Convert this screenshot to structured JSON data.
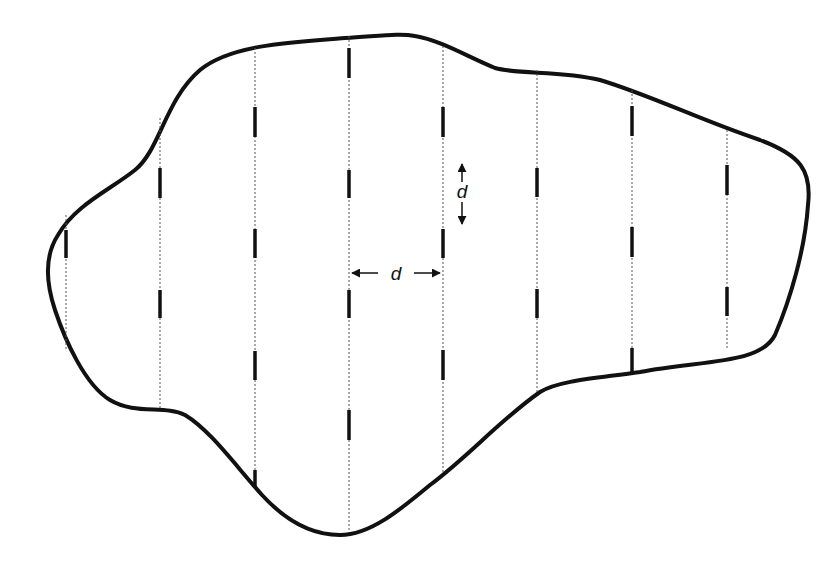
{
  "diagram": {
    "type": "systematic-line-transect-sampling",
    "boundary_color": "#111111",
    "transect_color": "#555555",
    "segment_color": "#111111",
    "spacing_label_horizontal": "d",
    "spacing_label_vertical": "d",
    "transects": [
      {
        "x": 66,
        "y_top": 215,
        "y_bottom": 350,
        "segments": [
          [
            230,
            258
          ]
        ]
      },
      {
        "x": 160,
        "y_top": 118,
        "y_bottom": 410,
        "segments": [
          [
            168,
            198
          ],
          [
            290,
            318
          ]
        ]
      },
      {
        "x": 255,
        "y_top": 48,
        "y_bottom": 488,
        "segments": [
          [
            107,
            137
          ],
          [
            229,
            258
          ],
          [
            351,
            380
          ],
          [
            470,
            488
          ]
        ]
      },
      {
        "x": 349,
        "y_top": 36,
        "y_bottom": 532,
        "segments": [
          [
            48,
            78
          ],
          [
            170,
            198
          ],
          [
            290,
            318
          ],
          [
            410,
            440
          ]
        ]
      },
      {
        "x": 443,
        "y_top": 46,
        "y_bottom": 472,
        "segments": [
          [
            107,
            137
          ],
          [
            229,
            258
          ],
          [
            350,
            380
          ]
        ]
      },
      {
        "x": 537,
        "y_top": 70,
        "y_bottom": 392,
        "segments": [
          [
            168,
            197
          ],
          [
            289,
            318
          ]
        ]
      },
      {
        "x": 632,
        "y_top": 90,
        "y_bottom": 372,
        "segments": [
          [
            106,
            136
          ],
          [
            227,
            257
          ],
          [
            348,
            372
          ]
        ]
      },
      {
        "x": 727,
        "y_top": 130,
        "y_bottom": 348,
        "segments": [
          [
            165,
            195
          ],
          [
            287,
            316
          ]
        ]
      }
    ],
    "annotations": {
      "horizontal_d": {
        "x_from": 350,
        "x_to": 442,
        "y": 273,
        "label_x": 394
      },
      "vertical_d": {
        "x": 462,
        "y_from": 164,
        "y_to": 226,
        "label_y": 195
      }
    }
  }
}
